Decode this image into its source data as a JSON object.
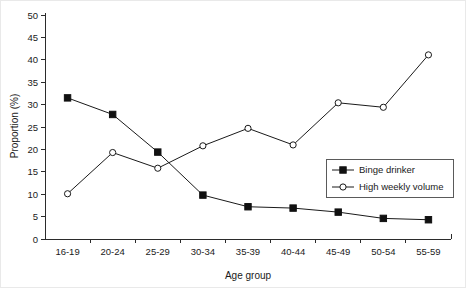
{
  "chart_data": {
    "type": "line",
    "title": "",
    "xlabel": "Age group",
    "ylabel": "Proportion (%)",
    "categories": [
      "16-19",
      "20-24",
      "25-29",
      "30-34",
      "35-39",
      "40-44",
      "45-49",
      "50-54",
      "55-59"
    ],
    "ylim": [
      0,
      50
    ],
    "yticks": [
      0,
      5,
      10,
      15,
      20,
      25,
      30,
      35,
      40,
      45,
      50
    ],
    "ytick_labels": [
      "0",
      "5",
      "10",
      "15",
      "20",
      "25",
      "30",
      "35",
      "40",
      "45",
      "50"
    ],
    "grid": false,
    "legend_position": "center-right",
    "series": [
      {
        "name": "Binge drinker",
        "marker": "filled-square",
        "values": [
          31.5,
          27.8,
          19.4,
          9.8,
          7.2,
          6.9,
          6.0,
          4.6,
          4.3
        ]
      },
      {
        "name": "High weekly volume",
        "marker": "open-circle",
        "values": [
          10.1,
          19.3,
          15.8,
          20.8,
          24.7,
          21.0,
          30.4,
          29.4,
          41.1
        ]
      }
    ]
  },
  "legend": {
    "entries": [
      {
        "label": "Binge drinker"
      },
      {
        "label": "High weekly volume"
      }
    ]
  },
  "colors": {
    "series_stroke": "#1a1a1a",
    "axis": "#2b2b2b",
    "background": "#ffffff",
    "legend_border": "#5a5a5a"
  }
}
